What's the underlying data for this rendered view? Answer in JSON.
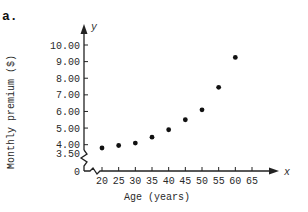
{
  "figure": {
    "part_label": "a.",
    "ink_color": "#222222",
    "background": "#ffffff"
  },
  "chart_data": {
    "type": "scatter",
    "title": "",
    "xlabel": "Age (years)",
    "ylabel": "Monthly premium ($)",
    "x_axis_symbol": "x",
    "y_axis_symbol": "y",
    "x": [
      20,
      25,
      30,
      35,
      40,
      45,
      50,
      55,
      60
    ],
    "y": [
      3.8,
      3.95,
      4.1,
      4.45,
      4.9,
      5.5,
      6.1,
      7.45,
      9.25
    ],
    "xticks": [
      "20",
      "25",
      "30",
      "35",
      "40",
      "45",
      "50",
      "55",
      "60",
      "65"
    ],
    "yticks": [
      "0",
      "3.50",
      "4.00",
      "5.00",
      "6.00",
      "7.00",
      "8.00",
      "9.00",
      "10.00"
    ],
    "xlim": [
      0,
      65
    ],
    "ylim": [
      0,
      10.5
    ],
    "axis_break": {
      "x": true,
      "y": true
    },
    "grid": false,
    "legend": null
  }
}
